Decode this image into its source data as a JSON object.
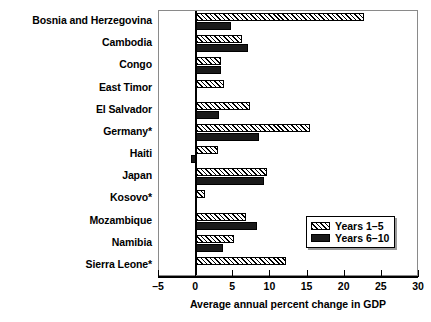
{
  "chart_data": {
    "type": "bar",
    "orientation": "horizontal",
    "title": "",
    "xlabel": "Average annual percent change in GDP",
    "ylabel": "",
    "xlim": [
      -5,
      30
    ],
    "xticks": [
      -5,
      0,
      5,
      10,
      15,
      20,
      25,
      30
    ],
    "xtick_labels": [
      "–5",
      "0",
      "5",
      "10",
      "15",
      "20",
      "25",
      "30"
    ],
    "grid": false,
    "legend_position": "lower right",
    "categories": [
      "Bosnia and Herzegovina",
      "Cambodia",
      "Congo",
      "East Timor",
      "El Salvador",
      "Germany*",
      "Haiti",
      "Japan",
      "Kosovo*",
      "Mozambique",
      "Namibia",
      "Sierra Leone*"
    ],
    "series": [
      {
        "name": "Years 1–5",
        "pattern": "diagonal-hatch",
        "values": [
          22.6,
          6.2,
          3.4,
          3.7,
          7.3,
          15.3,
          3.0,
          9.5,
          1.2,
          6.7,
          5.1,
          12.1
        ]
      },
      {
        "name": "Years 6–10",
        "pattern": "solid-black",
        "values": [
          4.7,
          7.0,
          3.4,
          null,
          3.1,
          8.4,
          -0.7,
          9.1,
          null,
          8.2,
          3.6,
          null
        ]
      }
    ]
  },
  "legend": {
    "items": [
      {
        "label": "Years 1–5",
        "style": "series-a"
      },
      {
        "label": "Years 6–10",
        "style": "series-b"
      }
    ]
  },
  "axis": {
    "x_title": "Average annual percent change in GDP"
  }
}
